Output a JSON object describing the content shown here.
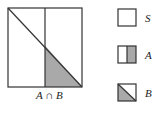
{
  "diagram": {
    "main": {
      "label": "A ∩ B",
      "description": "Unit square S divided by vertical midline (A = right half) and diagonal (B = lower-left triangle); intersection shaded"
    },
    "legend": [
      {
        "label": "S",
        "shape": "empty-square"
      },
      {
        "label": "A",
        "shape": "square-right-half-shaded"
      },
      {
        "label": "B",
        "shape": "square-lower-triangle-shaded"
      }
    ],
    "colors": {
      "stroke": "#333333",
      "shade": "#a9a9a9",
      "background": "#ffffff"
    }
  }
}
